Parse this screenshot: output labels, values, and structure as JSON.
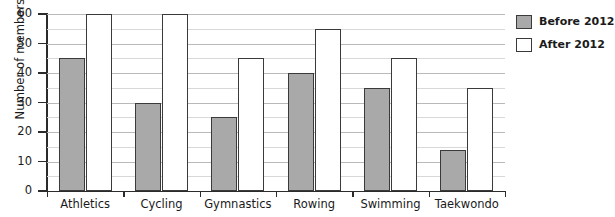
{
  "chart_data": {
    "type": "bar",
    "title": "",
    "xlabel": "",
    "ylabel": "Number of members",
    "ylim": [
      0,
      60
    ],
    "ytick_step": 10,
    "minor_gridline_step": 5,
    "grid": true,
    "legend_position": "right",
    "categories": [
      "Athletics",
      "Cycling",
      "Gymnastics",
      "Rowing",
      "Swimming",
      "Taekwondo"
    ],
    "series": [
      {
        "name": "Before 2012",
        "color": "#a9a9a9",
        "values": [
          45,
          30,
          25,
          40,
          35,
          14
        ]
      },
      {
        "name": "After 2012",
        "color": "#ffffff",
        "values": [
          60,
          60,
          45,
          55,
          45,
          35
        ]
      }
    ],
    "ytick_labels": [
      "0",
      "10",
      "20",
      "30",
      "40",
      "50",
      "60"
    ]
  },
  "legend": {
    "items": [
      {
        "label": "Before 2012",
        "swatch": "before"
      },
      {
        "label": "After 2012",
        "swatch": "after"
      }
    ]
  },
  "colors": {
    "before_fill": "#a9a9a9",
    "after_fill": "#ffffff",
    "bar_border": "#3a3a3a",
    "axis": "#2b2b2b",
    "gridline_major": "#b9b9b9",
    "gridline_minor": "#d8d8d8",
    "background": "#ffffff"
  }
}
